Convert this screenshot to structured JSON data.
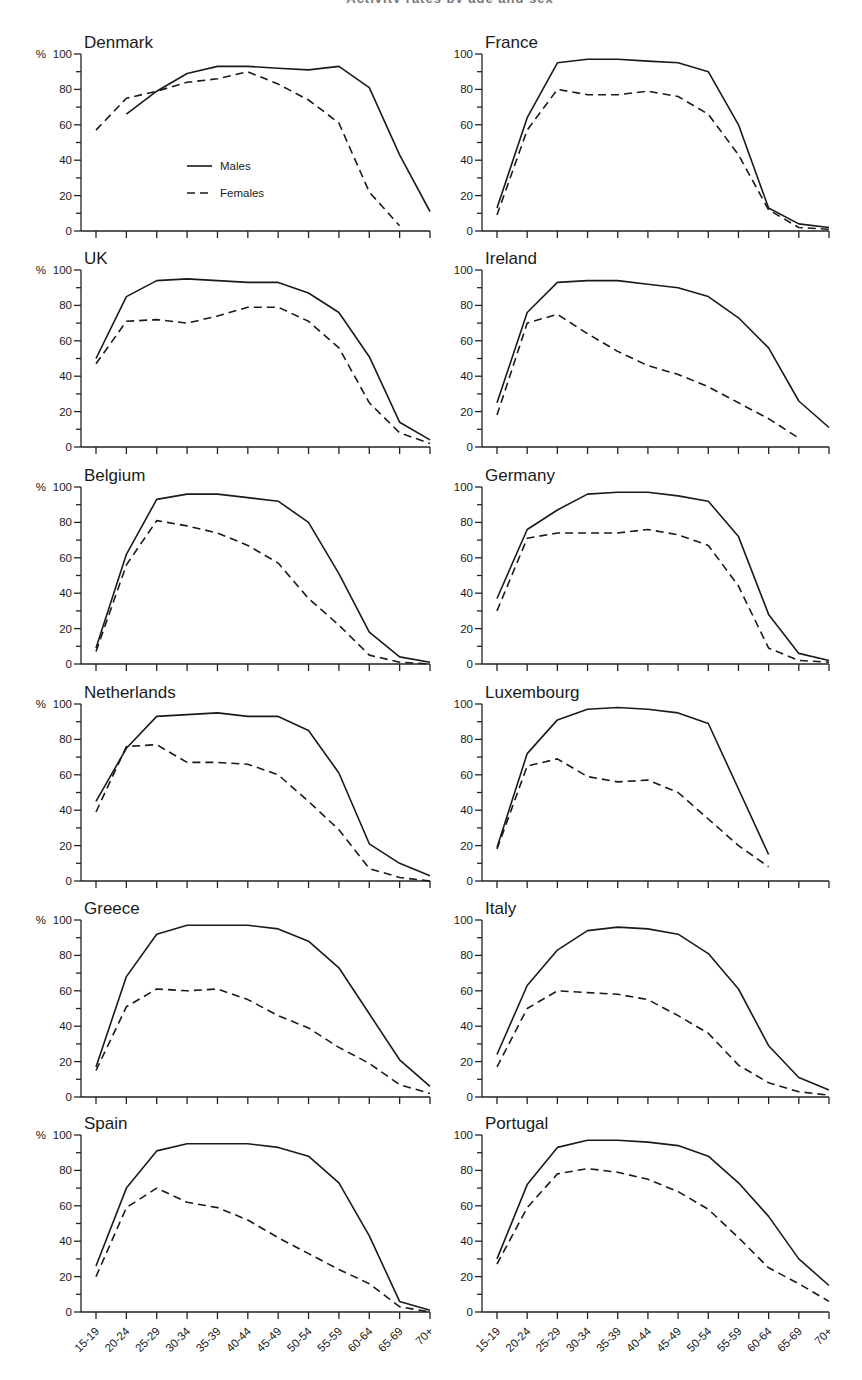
{
  "figure": {
    "title_fragment": "Activity rates by age and sex",
    "y_axis_unit": "%",
    "legend": {
      "males_label": "Males",
      "females_label": "Females"
    }
  },
  "chart_data": [
    {
      "type": "line",
      "title": "Denmark",
      "xlabel": "",
      "ylabel": "%",
      "ylim": [
        0,
        100
      ],
      "grid": false,
      "legend": [
        "Males",
        "Females"
      ],
      "legend_position": "inside lower-left",
      "categories": [
        "15-19",
        "20-24",
        "25-29",
        "30-34",
        "35-39",
        "40-44",
        "45-49",
        "50-54",
        "55-59",
        "60-64",
        "65-69",
        "70+"
      ],
      "series": [
        {
          "name": "Males",
          "values": [
            null,
            66,
            79,
            89,
            93,
            93,
            92,
            91,
            93,
            81,
            43,
            11
          ]
        },
        {
          "name": "Females",
          "values": [
            57,
            75,
            79,
            84,
            86,
            90,
            83,
            74,
            61,
            22,
            3,
            null
          ]
        }
      ]
    },
    {
      "type": "line",
      "title": "France",
      "xlabel": "",
      "ylabel": "%",
      "ylim": [
        0,
        100
      ],
      "grid": false,
      "categories": [
        "15-19",
        "20-24",
        "25-29",
        "30-34",
        "35-39",
        "40-44",
        "45-49",
        "50-54",
        "55-59",
        "60-64",
        "65-69",
        "70+"
      ],
      "series": [
        {
          "name": "Males",
          "values": [
            13,
            64,
            95,
            97,
            97,
            96,
            95,
            90,
            60,
            13,
            4,
            2
          ]
        },
        {
          "name": "Females",
          "values": [
            9,
            57,
            80,
            77,
            77,
            79,
            76,
            66,
            43,
            12,
            2,
            1
          ]
        }
      ]
    },
    {
      "type": "line",
      "title": "UK",
      "xlabel": "",
      "ylabel": "%",
      "ylim": [
        0,
        100
      ],
      "grid": false,
      "categories": [
        "15-19",
        "20-24",
        "25-29",
        "30-34",
        "35-39",
        "40-44",
        "45-49",
        "50-54",
        "55-59",
        "60-64",
        "65-69",
        "70+"
      ],
      "series": [
        {
          "name": "Males",
          "values": [
            50,
            85,
            94,
            95,
            94,
            93,
            93,
            87,
            76,
            51,
            14,
            4
          ]
        },
        {
          "name": "Females",
          "values": [
            47,
            71,
            72,
            70,
            74,
            79,
            79,
            71,
            56,
            25,
            8,
            2
          ]
        }
      ]
    },
    {
      "type": "line",
      "title": "Ireland",
      "xlabel": "",
      "ylabel": "%",
      "ylim": [
        0,
        100
      ],
      "grid": false,
      "categories": [
        "15-19",
        "20-24",
        "25-29",
        "30-34",
        "35-39",
        "40-44",
        "45-49",
        "50-54",
        "55-59",
        "60-64",
        "65-69",
        "70+"
      ],
      "series": [
        {
          "name": "Males",
          "values": [
            25,
            76,
            93,
            94,
            94,
            92,
            90,
            85,
            73,
            56,
            26,
            11
          ]
        },
        {
          "name": "Females",
          "values": [
            18,
            70,
            75,
            64,
            54,
            46,
            41,
            34,
            25,
            16,
            5,
            null
          ]
        }
      ]
    },
    {
      "type": "line",
      "title": "Belgium",
      "xlabel": "",
      "ylabel": "%",
      "ylim": [
        0,
        100
      ],
      "grid": false,
      "categories": [
        "15-19",
        "20-24",
        "25-29",
        "30-34",
        "35-39",
        "40-44",
        "45-49",
        "50-54",
        "55-59",
        "60-64",
        "65-69",
        "70+"
      ],
      "series": [
        {
          "name": "Males",
          "values": [
            9,
            62,
            93,
            96,
            96,
            94,
            92,
            80,
            51,
            18,
            4,
            1
          ]
        },
        {
          "name": "Females",
          "values": [
            7,
            56,
            81,
            78,
            74,
            67,
            57,
            37,
            22,
            5,
            1,
            0
          ]
        }
      ]
    },
    {
      "type": "line",
      "title": "Germany",
      "xlabel": "",
      "ylabel": "%",
      "ylim": [
        0,
        100
      ],
      "grid": false,
      "categories": [
        "15-19",
        "20-24",
        "25-29",
        "30-34",
        "35-39",
        "40-44",
        "45-49",
        "50-54",
        "55-59",
        "60-64",
        "65-69",
        "70+"
      ],
      "series": [
        {
          "name": "Males",
          "values": [
            37,
            76,
            87,
            96,
            97,
            97,
            95,
            92,
            72,
            28,
            6,
            2
          ]
        },
        {
          "name": "Females",
          "values": [
            30,
            71,
            74,
            74,
            74,
            76,
            73,
            67,
            44,
            9,
            2,
            1
          ]
        }
      ]
    },
    {
      "type": "line",
      "title": "Netherlands",
      "xlabel": "",
      "ylabel": "%",
      "ylim": [
        0,
        100
      ],
      "grid": false,
      "categories": [
        "15-19",
        "20-24",
        "25-29",
        "30-34",
        "35-39",
        "40-44",
        "45-49",
        "50-54",
        "55-59",
        "60-64",
        "65-69",
        "70+"
      ],
      "series": [
        {
          "name": "Males",
          "values": [
            45,
            75,
            93,
            94,
            95,
            93,
            93,
            85,
            61,
            21,
            10,
            3
          ]
        },
        {
          "name": "Females",
          "values": [
            39,
            76,
            77,
            67,
            67,
            66,
            60,
            45,
            29,
            7,
            2,
            0
          ]
        }
      ]
    },
    {
      "type": "line",
      "title": "Luxembourg",
      "xlabel": "",
      "ylabel": "%",
      "ylim": [
        0,
        100
      ],
      "grid": false,
      "categories": [
        "15-19",
        "20-24",
        "25-29",
        "30-34",
        "35-39",
        "40-44",
        "45-49",
        "50-54",
        "55-59",
        "60-64",
        "65-69",
        "70+"
      ],
      "series": [
        {
          "name": "Males",
          "values": [
            19,
            72,
            91,
            97,
            98,
            97,
            95,
            89,
            52,
            15,
            null,
            null
          ]
        },
        {
          "name": "Females",
          "values": [
            18,
            65,
            69,
            59,
            56,
            57,
            50,
            35,
            20,
            8,
            null,
            null
          ]
        }
      ]
    },
    {
      "type": "line",
      "title": "Greece",
      "xlabel": "",
      "ylabel": "%",
      "ylim": [
        0,
        100
      ],
      "grid": false,
      "categories": [
        "15-19",
        "20-24",
        "25-29",
        "30-34",
        "35-39",
        "40-44",
        "45-49",
        "50-54",
        "55-59",
        "60-64",
        "65-69",
        "70+"
      ],
      "series": [
        {
          "name": "Males",
          "values": [
            17,
            68,
            92,
            97,
            97,
            97,
            95,
            88,
            73,
            47,
            21,
            6
          ]
        },
        {
          "name": "Females",
          "values": [
            15,
            51,
            61,
            60,
            61,
            55,
            46,
            39,
            28,
            19,
            7,
            2
          ]
        }
      ]
    },
    {
      "type": "line",
      "title": "Italy",
      "xlabel": "",
      "ylabel": "%",
      "ylim": [
        0,
        100
      ],
      "grid": false,
      "categories": [
        "15-19",
        "20-24",
        "25-29",
        "30-34",
        "35-39",
        "40-44",
        "45-49",
        "50-54",
        "55-59",
        "60-64",
        "65-69",
        "70+"
      ],
      "series": [
        {
          "name": "Males",
          "values": [
            24,
            63,
            83,
            94,
            96,
            95,
            92,
            81,
            61,
            29,
            11,
            4
          ]
        },
        {
          "name": "Females",
          "values": [
            17,
            50,
            60,
            59,
            58,
            55,
            46,
            36,
            18,
            8,
            3,
            1
          ]
        }
      ]
    },
    {
      "type": "line",
      "title": "Spain",
      "xlabel": "",
      "ylabel": "%",
      "ylim": [
        0,
        100
      ],
      "grid": false,
      "categories": [
        "15-19",
        "20-24",
        "25-29",
        "30-34",
        "35-39",
        "40-44",
        "45-49",
        "50-54",
        "55-59",
        "60-64",
        "65-69",
        "70+"
      ],
      "series": [
        {
          "name": "Males",
          "values": [
            26,
            70,
            91,
            95,
            95,
            95,
            93,
            88,
            73,
            43,
            6,
            1
          ]
        },
        {
          "name": "Females",
          "values": [
            20,
            59,
            70,
            62,
            59,
            52,
            42,
            33,
            24,
            16,
            3,
            0
          ]
        }
      ]
    },
    {
      "type": "line",
      "title": "Portugal",
      "xlabel": "",
      "ylabel": "%",
      "ylim": [
        0,
        100
      ],
      "grid": false,
      "categories": [
        "15-19",
        "20-24",
        "25-29",
        "30-34",
        "35-39",
        "40-44",
        "45-49",
        "50-54",
        "55-59",
        "60-64",
        "65-69",
        "70+"
      ],
      "series": [
        {
          "name": "Males",
          "values": [
            30,
            72,
            93,
            97,
            97,
            96,
            94,
            88,
            73,
            54,
            30,
            15
          ]
        },
        {
          "name": "Females",
          "values": [
            27,
            59,
            78,
            81,
            79,
            75,
            68,
            58,
            42,
            25,
            16,
            6
          ]
        }
      ]
    }
  ]
}
